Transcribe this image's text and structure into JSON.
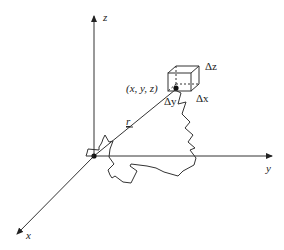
{
  "diagram": {
    "axes": {
      "z_label": "z",
      "y_label": "y",
      "x_label": "x"
    },
    "point_label": "(x, y, z)",
    "vector_label": "r",
    "cube_labels": {
      "dx": "Δx",
      "dy": "Δy",
      "dz": "Δz"
    },
    "colors": {
      "stroke": "#333333",
      "background": "#ffffff"
    }
  }
}
